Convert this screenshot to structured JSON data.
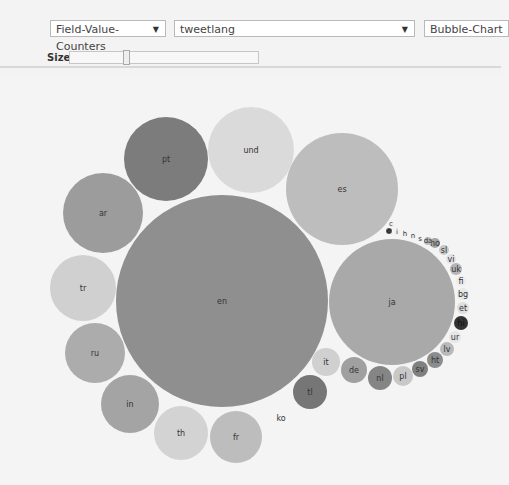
{
  "toolbar": {
    "mode_select": "Field-Value-Counters",
    "field_select": "tweetlang",
    "chart_select": "Bubble-Chart",
    "size_label": "Size:",
    "dropdown_arrow": "▼"
  },
  "chart_data": {
    "type": "bubble",
    "title": "",
    "field": "tweetlang",
    "bubbles": [
      {
        "label": "en",
        "cx": 222,
        "cy": 301,
        "r": 106,
        "color": "#8f8f8f"
      },
      {
        "label": "ja",
        "cx": 392,
        "cy": 302,
        "r": 63,
        "color": "#a9a9a9"
      },
      {
        "label": "es",
        "cx": 342,
        "cy": 189,
        "r": 56,
        "color": "#bdbdbd"
      },
      {
        "label": "und",
        "cx": 251,
        "cy": 150,
        "r": 43,
        "color": "#dadada"
      },
      {
        "label": "pt",
        "cx": 166,
        "cy": 159,
        "r": 42,
        "color": "#7c7c7c"
      },
      {
        "label": "ar",
        "cx": 103,
        "cy": 213,
        "r": 40,
        "color": "#9c9c9c"
      },
      {
        "label": "tr",
        "cx": 83,
        "cy": 288,
        "r": 33,
        "color": "#d0d0d0"
      },
      {
        "label": "ru",
        "cx": 95,
        "cy": 353,
        "r": 30,
        "color": "#acacac"
      },
      {
        "label": "in",
        "cx": 130,
        "cy": 404,
        "r": 29,
        "color": "#a4a4a4"
      },
      {
        "label": "th",
        "cx": 181,
        "cy": 433,
        "r": 27,
        "color": "#d3d3d3"
      },
      {
        "label": "fr",
        "cx": 236,
        "cy": 437,
        "r": 26,
        "color": "#bdbdbd"
      },
      {
        "label": "ko",
        "cx": 281,
        "cy": 418,
        "r": 10,
        "color": "#f4f4f4"
      },
      {
        "label": "tl",
        "cx": 310,
        "cy": 392,
        "r": 17,
        "color": "#767676"
      },
      {
        "label": "it",
        "cx": 326,
        "cy": 362,
        "r": 14,
        "color": "#d0d0d0"
      },
      {
        "label": "de",
        "cx": 354,
        "cy": 370,
        "r": 13,
        "color": "#a0a0a0"
      },
      {
        "label": "nl",
        "cx": 380,
        "cy": 378,
        "r": 12,
        "color": "#858585"
      },
      {
        "label": "pl",
        "cx": 403,
        "cy": 376,
        "r": 10,
        "color": "#c8c8c8"
      },
      {
        "label": "sv",
        "cx": 420,
        "cy": 369,
        "r": 8,
        "color": "#808080"
      },
      {
        "label": "ht",
        "cx": 435,
        "cy": 360,
        "r": 8,
        "color": "#8c8c8c"
      },
      {
        "label": "lv",
        "cx": 447,
        "cy": 349,
        "r": 7,
        "color": "#b9b9b9"
      },
      {
        "label": "ur",
        "cx": 455,
        "cy": 337,
        "r": 6,
        "color": "#e6e6e6"
      },
      {
        "label": "hi",
        "cx": 461,
        "cy": 323,
        "r": 7,
        "color": "#333333"
      },
      {
        "label": "et",
        "cx": 463,
        "cy": 308,
        "r": 6,
        "color": "#dedede"
      },
      {
        "label": "bg",
        "cx": 463,
        "cy": 294,
        "r": 6,
        "color": "#e8e8e8"
      },
      {
        "label": "fi",
        "cx": 461,
        "cy": 281,
        "r": 5,
        "color": "#ececec"
      },
      {
        "label": "uk",
        "cx": 456,
        "cy": 269,
        "r": 6,
        "color": "#b5b5b5"
      },
      {
        "label": "vi",
        "cx": 451,
        "cy": 259,
        "r": 5,
        "color": "#e2e2e2"
      },
      {
        "label": "sl",
        "cx": 444,
        "cy": 250,
        "r": 5,
        "color": "#c7c7c7"
      },
      {
        "label": "no",
        "cx": 435,
        "cy": 243,
        "r": 5,
        "color": "#a3a3a3"
      },
      {
        "label": "da",
        "cx": 428,
        "cy": 241,
        "r": 4,
        "color": "#bbbbbb"
      },
      {
        "label": "s",
        "cx": 420,
        "cy": 239,
        "r": 3,
        "color": "#f0f0f0"
      },
      {
        "label": "n",
        "cx": 413,
        "cy": 236,
        "r": 3,
        "color": "#f0f0f0"
      },
      {
        "label": "h",
        "cx": 405,
        "cy": 234,
        "r": 3,
        "color": "#f0f0f0"
      },
      {
        "label": "i",
        "cx": 397,
        "cy": 232,
        "r": 3,
        "color": "#f0f0f0"
      },
      {
        "label": "e",
        "cx": 389,
        "cy": 231,
        "r": 3,
        "color": "#555555"
      },
      {
        "label": "c",
        "cx": 391,
        "cy": 224,
        "r": 3,
        "color": "#f0f0f0"
      }
    ]
  }
}
